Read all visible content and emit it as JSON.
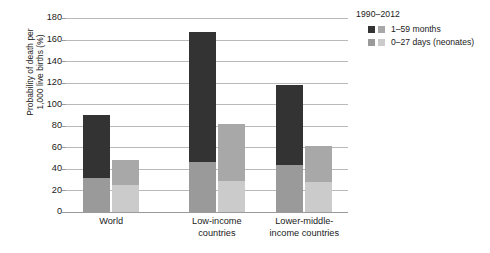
{
  "chart_data": {
    "type": "bar",
    "title": "",
    "subtitle": "",
    "xlabel": "",
    "ylabel": "Probability of death per 1,000 live births (%)",
    "ylabel_line1": "Probability of death per",
    "ylabel_line2": "1,000 live births (%)",
    "ylim": [
      0,
      180
    ],
    "ytick_step": 20,
    "yticks": [
      0,
      20,
      40,
      60,
      80,
      100,
      120,
      140,
      160,
      180
    ],
    "ytick_labels": [
      "0",
      "20",
      "40",
      "60",
      "80",
      "100",
      "120",
      "140",
      "160",
      "180"
    ],
    "grid": true,
    "grid_axis": "y",
    "legend_position": "right",
    "categories": [
      "World",
      "Low-income countries",
      "Lower-middle-income countries"
    ],
    "category_labels": [
      [
        "World"
      ],
      [
        "Low-income",
        "countries"
      ],
      [
        "Lower-middle-",
        "income countries"
      ]
    ],
    "stack_order_bottom_to_top": [
      "0–27 days (neonates)",
      "1–59 months"
    ],
    "groups": [
      {
        "category": "World",
        "bars": [
          {
            "year": "1990",
            "total": 90,
            "segments": [
              {
                "name": "0–27 days (neonates)",
                "value": 32,
                "color": "#9a9a9a"
              },
              {
                "name": "1–59 months",
                "value": 58,
                "color": "#333333"
              }
            ]
          },
          {
            "year": "2012",
            "total": 48,
            "segments": [
              {
                "name": "0–27 days (neonates)",
                "value": 25,
                "color": "#cbcbcb"
              },
              {
                "name": "1–59 months",
                "value": 23,
                "color": "#a8a8a8"
              }
            ]
          }
        ]
      },
      {
        "category": "Low-income countries",
        "bars": [
          {
            "year": "1990",
            "total": 167,
            "segments": [
              {
                "name": "0–27 days (neonates)",
                "value": 46,
                "color": "#9a9a9a"
              },
              {
                "name": "1–59 months",
                "value": 121,
                "color": "#333333"
              }
            ]
          },
          {
            "year": "2012",
            "total": 82,
            "segments": [
              {
                "name": "0–27 days (neonates)",
                "value": 29,
                "color": "#cbcbcb"
              },
              {
                "name": "1–59 months",
                "value": 53,
                "color": "#a8a8a8"
              }
            ]
          }
        ]
      },
      {
        "category": "Lower-middle-income countries",
        "bars": [
          {
            "year": "1990",
            "total": 118,
            "segments": [
              {
                "name": "0–27 days (neonates)",
                "value": 44,
                "color": "#9a9a9a"
              },
              {
                "name": "1–59 months",
                "value": 74,
                "color": "#333333"
              }
            ]
          },
          {
            "year": "2012",
            "total": 61,
            "segments": [
              {
                "name": "0–27 days (neonates)",
                "value": 28,
                "color": "#cbcbcb"
              },
              {
                "name": "1–59 months",
                "value": 33,
                "color": "#a8a8a8"
              }
            ]
          }
        ]
      }
    ],
    "legend": {
      "title": "1990–2012",
      "entries": [
        {
          "label": "1–59 months",
          "swatches": [
            {
              "year": "1990",
              "color": "#333333"
            },
            {
              "year": "2012",
              "color": "#a8a8a8"
            }
          ]
        },
        {
          "label": "0–27 days (neonates)",
          "swatches": [
            {
              "year": "1990",
              "color": "#9a9a9a"
            },
            {
              "year": "2012",
              "color": "#cbcbcb"
            }
          ]
        }
      ]
    },
    "colors": {
      "older_1990": "#333333",
      "neonates_1990": "#9a9a9a",
      "older_2012": "#a8a8a8",
      "neonates_2012": "#cbcbcb",
      "gridline": "#b9b9b9",
      "axis": "#9a9a9a",
      "text": "#1a1a1a",
      "background": "#ffffff"
    }
  }
}
